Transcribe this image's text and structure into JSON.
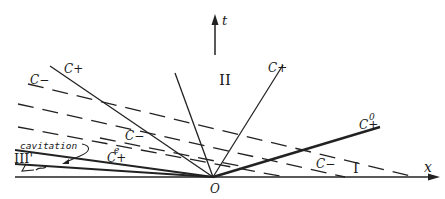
{
  "diagram": {
    "axes": {
      "x_label": "x",
      "t_label": "t",
      "origin_label": "O"
    },
    "regions": {
      "region_1": "I",
      "region_2": "II",
      "region_3": "III'"
    },
    "characteristics": {
      "c_plus_left": "C+",
      "c_plus_right": "C+",
      "c_minus_upper_left": "C−",
      "c_minus_middle": "C−",
      "c_minus_right": "C−",
      "c_plus_e": "C+",
      "c_plus_e_sup": "e",
      "c_plus_0": "C+",
      "c_plus_0_sup": "0"
    },
    "annotations": {
      "cavitation": "cavitation"
    }
  }
}
